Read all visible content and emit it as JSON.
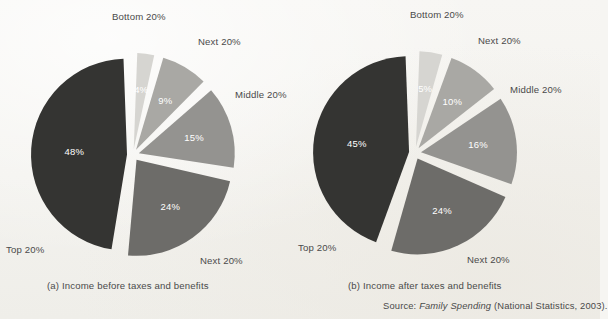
{
  "figure": {
    "background_color": "#f6f5f2",
    "source": {
      "prefix": "Source: ",
      "italic_title": "Family Spending",
      "suffix": " (National Statistics, 2003)."
    }
  },
  "palette": {
    "slice_lightest": "#d6d5d1",
    "slice_light": "#a9a8a4",
    "slice_medium": "#949390",
    "slice_dark": "#6d6c69",
    "slice_darkest": "#343432",
    "gap": "#f6f5f2",
    "label_on_dark": "#ffffff",
    "label_on_light": "#4a4a4a",
    "text": "#4a4a4a"
  },
  "chart_data": [
    {
      "type": "pie",
      "id": "chart-a",
      "title": "(a) Income before taxes and benefits",
      "caption": "(a) Income before taxes and benefits",
      "exploded": true,
      "start_angle_deg": 0,
      "direction": "clockwise",
      "categories": [
        "Bottom 20%",
        "Next 20%",
        "Middle 20%",
        "Next 20%",
        "Top 20%"
      ],
      "values": [
        4,
        9,
        15,
        24,
        48
      ],
      "value_labels": [
        "4%",
        "9%",
        "15%",
        "24%",
        "48%"
      ],
      "colors": [
        "#d6d5d1",
        "#a9a8a4",
        "#949390",
        "#6d6c69",
        "#343432"
      ],
      "label_colors": [
        "#4a4a4a",
        "#4a4a4a",
        "#ffffff",
        "#ffffff",
        "#ffffff"
      ],
      "units": "percent",
      "legend": "none",
      "grid": false
    },
    {
      "type": "pie",
      "id": "chart-b",
      "title": "(b) Income after taxes and benefits",
      "caption": "(b) Income after taxes and benefits",
      "exploded": true,
      "start_angle_deg": 0,
      "direction": "clockwise",
      "categories": [
        "Bottom 20%",
        "Next 20%",
        "Middle 20%",
        "Next 20%",
        "Top 20%"
      ],
      "values": [
        5,
        10,
        16,
        24,
        45
      ],
      "value_labels": [
        "5%",
        "10%",
        "16%",
        "24%",
        "45%"
      ],
      "colors": [
        "#d6d5d1",
        "#a9a8a4",
        "#949390",
        "#6d6c69",
        "#343432"
      ],
      "label_colors": [
        "#4a4a4a",
        "#4a4a4a",
        "#ffffff",
        "#ffffff",
        "#ffffff"
      ],
      "units": "percent",
      "legend": "none",
      "grid": false
    }
  ],
  "chart_a": {
    "caption": "(a) Income before taxes and benefits",
    "callouts": {
      "bottom20": "Bottom 20%",
      "next20_upper": "Next 20%",
      "middle20": "Middle 20%",
      "next20_lower": "Next 20%",
      "top20": "Top 20%"
    },
    "values": {
      "bottom20": "4%",
      "next20_upper": "9%",
      "middle20": "15%",
      "next20_lower": "24%",
      "top20": "48%"
    }
  },
  "chart_b": {
    "caption": "(b) Income after taxes and benefits",
    "callouts": {
      "bottom20": "Bottom 20%",
      "next20_upper": "Next 20%",
      "middle20": "Middle 20%",
      "next20_lower": "Next 20%",
      "top20": "Top 20%"
    },
    "values": {
      "bottom20": "5%",
      "next20_upper": "10%",
      "middle20": "16%",
      "next20_lower": "24%",
      "top20": "45%"
    }
  }
}
